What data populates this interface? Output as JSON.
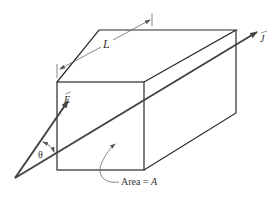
{
  "diagram": {
    "labels": {
      "length": "L",
      "efield": "E",
      "current_density": "J",
      "angle": "θ",
      "area_prefix": "Area = ",
      "area_var": "A"
    },
    "colors": {
      "edge": "#2a2a2a",
      "arrow": "#444444",
      "text": "#333333",
      "background": "#ffffff"
    }
  }
}
